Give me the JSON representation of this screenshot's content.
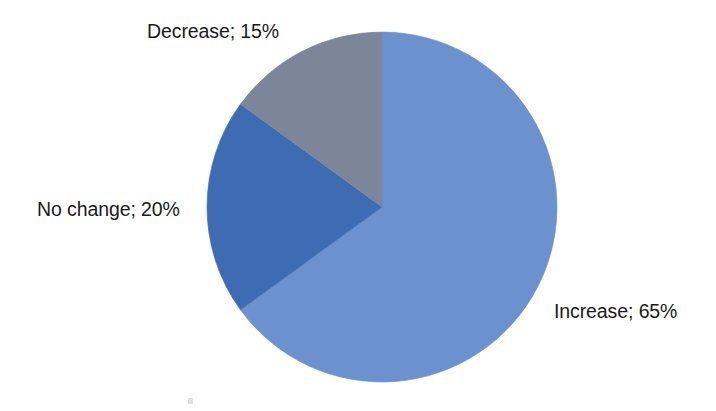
{
  "chart_data": {
    "type": "pie",
    "title": "",
    "subtitle": "",
    "xlabel": "",
    "ylabel": "",
    "legend_position": "none",
    "grid": false,
    "labels_outside": true,
    "start_angle_deg": 0,
    "direction": "clockwise",
    "categories": [
      "Increase",
      "No change",
      "Decrease"
    ],
    "values": [
      65,
      20,
      15
    ],
    "unit": "%",
    "colors": [
      "#6b92cf",
      "#3d6cb3",
      "#7d8699"
    ],
    "slices": [
      {
        "name": "Increase",
        "value": 65,
        "label": "Increase; 65%",
        "color": "#6b92cf",
        "start_deg": 0,
        "end_deg": 234
      },
      {
        "name": "No change",
        "value": 20,
        "label": "No change; 20%",
        "color": "#3d6cb3",
        "start_deg": 234,
        "end_deg": 306
      },
      {
        "name": "Decrease",
        "value": 15,
        "label": "Decrease; 15%",
        "color": "#7d8699",
        "start_deg": 306,
        "end_deg": 360
      }
    ],
    "annotations": []
  },
  "canvas": {
    "background": "#ffffff",
    "center_x": 382,
    "center_y": 207,
    "radius": 175
  },
  "labels": {
    "decrease": "Decrease; 15%",
    "no_change": "No change; 20%",
    "increase": "Increase; 65%"
  }
}
